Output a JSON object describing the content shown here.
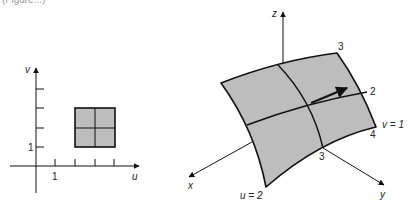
{
  "caption": "(Figure...)",
  "colors": {
    "surface_fill": "#bdbdbd",
    "line": "#111111",
    "background": "#ffffff"
  },
  "left_plot": {
    "u_axis_label": "u",
    "v_axis_label": "v",
    "u_tick_label": "1",
    "v_tick_label": "1",
    "u_ticks": [
      1,
      2,
      3,
      4
    ],
    "v_ticks": [
      1,
      2,
      3,
      4
    ],
    "square": {
      "u_range": [
        2,
        4
      ],
      "v_range": [
        1,
        3
      ],
      "grid_lines": [
        "u=3",
        "v=2"
      ]
    }
  },
  "right_plot": {
    "x_axis_label": "x",
    "y_axis_label": "y",
    "z_axis_label": "z",
    "u_label": "u = 2",
    "v_label": "v = 1",
    "u_values": [
      "3",
      "4"
    ],
    "v_values": [
      "2",
      "3"
    ],
    "tangent_vector": "arrow at (u=3, v=2)"
  }
}
